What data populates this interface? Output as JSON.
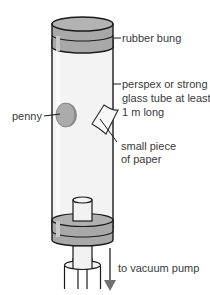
{
  "diagram": {
    "labels": {
      "rubber_bung": "rubber bung",
      "tube_line1": "perspex or strong",
      "tube_line2": "glass tube at least",
      "tube_line3": "1 m long",
      "penny": "penny",
      "paper_line1": "small piece",
      "paper_line2": "of paper",
      "vacuum_pump": "to vacuum pump"
    },
    "colors": {
      "outline": "#1a1a1a",
      "bung_fill": "#a6a6a6",
      "bung_top": "#b5b5b5",
      "tube_fill": "#f4f4f4",
      "penny_fill": "#a9a9a9",
      "arrow": "#707070",
      "text": "#3a3a3a"
    }
  }
}
